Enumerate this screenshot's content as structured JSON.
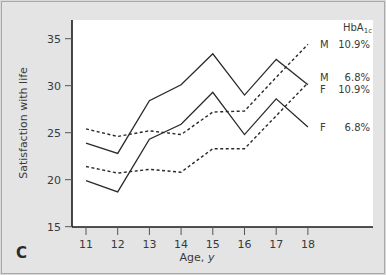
{
  "chart_data": {
    "type": "line",
    "panel_label": "C",
    "title": "",
    "xlabel": "Age, y",
    "ylabel": "Satisfaction with life",
    "x": [
      11,
      12,
      13,
      14,
      15,
      16,
      17,
      18
    ],
    "x_ticks": [
      "11",
      "12",
      "13",
      "14",
      "15",
      "16",
      "17",
      "18"
    ],
    "y_ticks": [
      "15",
      "20",
      "25",
      "30",
      "35"
    ],
    "ylim": [
      15,
      36.5
    ],
    "xlim": [
      10.5,
      19.2
    ],
    "grid": false,
    "legend_title": "HbA1c",
    "legend_position": "right, at line ends",
    "series": [
      {
        "name": "M 10.9%",
        "sex": "M",
        "hba1c": "10.9%",
        "style": "dashed",
        "values": [
          25.4,
          24.6,
          25.2,
          24.8,
          27.2,
          27.3,
          30.9,
          34.4
        ]
      },
      {
        "name": "M 6.8%",
        "sex": "M",
        "hba1c": "6.8%",
        "style": "solid",
        "values": [
          23.9,
          22.8,
          28.4,
          30.1,
          33.4,
          29.0,
          32.8,
          30.1
        ]
      },
      {
        "name": "F 10.9%",
        "sex": "F",
        "hba1c": "10.9%",
        "style": "dashed",
        "values": [
          21.4,
          20.7,
          21.1,
          20.8,
          23.3,
          23.3,
          26.8,
          30.3
        ]
      },
      {
        "name": "F 6.8%",
        "sex": "F",
        "hba1c": "6.8%",
        "style": "solid",
        "values": [
          19.9,
          18.7,
          24.3,
          25.9,
          29.3,
          24.8,
          28.6,
          25.6
        ]
      }
    ],
    "legend_entries": [
      {
        "sex": "M",
        "value": "10.9%",
        "y": 34.4
      },
      {
        "sex": "M",
        "value": "6.8%",
        "y": 30.9
      },
      {
        "sex": "F",
        "value": "10.9%",
        "y": 29.6
      },
      {
        "sex": "F",
        "value": "6.8%",
        "y": 25.6
      }
    ]
  }
}
